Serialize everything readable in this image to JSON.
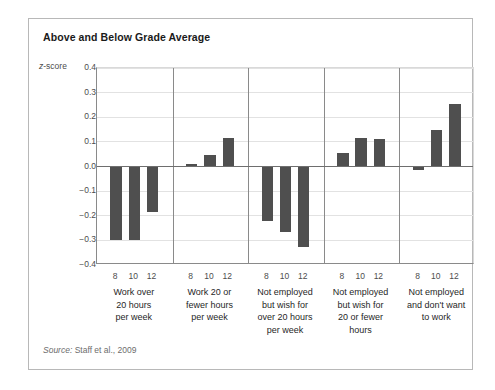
{
  "figure": {
    "title": "Above and Below Grade Average",
    "y_axis_label_prefix": "z",
    "y_axis_label_suffix": "-score",
    "source_prefix": "Source:",
    "source_text": "Staff et al., 2009"
  },
  "chart_data": {
    "type": "bar",
    "title": "Above and Below Grade Average",
    "xlabel": "",
    "ylabel": "z-score",
    "ylim": [
      -0.4,
      0.4
    ],
    "ytick_labels": [
      "0.4",
      "0.3",
      "0.2",
      "0.1",
      "0.0",
      "−0.1",
      "−0.2",
      "−0.3",
      "−0.4"
    ],
    "ytick_values": [
      0.4,
      0.3,
      0.2,
      0.1,
      0.0,
      -0.1,
      -0.2,
      -0.3,
      -0.4
    ],
    "grid": true,
    "legend": "none",
    "bar_color": "#4f4f4f",
    "categories": [
      "8",
      "10",
      "12"
    ],
    "category_axis_name": "grade",
    "groups": [
      {
        "label": "Work over\n20 hours\nper week",
        "label_lines": [
          "Work over",
          "20 hours",
          "per week"
        ],
        "values": [
          -0.3,
          -0.3,
          -0.185
        ]
      },
      {
        "label": "Work 20 or\nfewer hours\nper week",
        "label_lines": [
          "Work 20 or",
          "fewer hours",
          "per week"
        ],
        "values": [
          0.012,
          0.045,
          0.115
        ]
      },
      {
        "label": "Not employed\nbut wish for\nover 20 hours\nper week",
        "label_lines": [
          "Not employed",
          "but wish for",
          "over 20 hours",
          "per week"
        ],
        "values": [
          -0.22,
          -0.265,
          -0.325
        ]
      },
      {
        "label": "Not employed\nbut wish for\n20 or fewer\nhours",
        "label_lines": [
          "Not employed",
          "but wish for",
          "20 or fewer",
          "hours"
        ],
        "values": [
          0.055,
          0.115,
          0.11
        ]
      },
      {
        "label": "Not employed\nand don't want\nto work",
        "label_lines": [
          "Not employed",
          "and don't want",
          "to work"
        ],
        "values": [
          -0.015,
          0.15,
          0.255
        ]
      }
    ]
  }
}
